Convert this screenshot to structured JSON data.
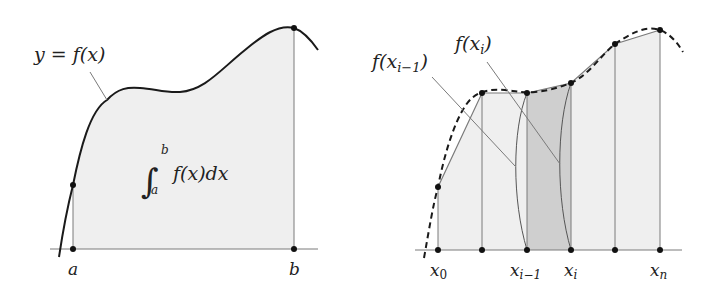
{
  "colors": {
    "background": "#ffffff",
    "curve": "#1a1a1a",
    "fill_light": "#efefef",
    "fill_dark": "#cfcfcf",
    "guide": "#7a7a7a",
    "point": "#111111"
  },
  "left_panel": {
    "curve_label": "y = f(x)",
    "integral": {
      "symbol": "∫",
      "upper": "b",
      "lower": "a",
      "integrand": "f(x)dx"
    },
    "x_labels": {
      "a": "a",
      "b": "b"
    }
  },
  "right_panel": {
    "labels": {
      "f_prev": "f(x",
      "f_prev_sub": "i−1",
      "f_prev_close": ")",
      "f_cur": "f(x",
      "f_cur_sub": "i",
      "f_cur_close": ")"
    },
    "x_labels": [
      {
        "main": "x",
        "sub": "0"
      },
      {
        "main": "x",
        "sub": "i−1"
      },
      {
        "main": "x",
        "sub": "i"
      },
      {
        "main": "x",
        "sub": "n"
      }
    ],
    "nodes_x": [
      438,
      482,
      527,
      571,
      615,
      660
    ],
    "nodes_y": [
      187,
      93,
      93,
      83,
      44,
      30
    ],
    "highlighted_interval": [
      2,
      3
    ]
  }
}
